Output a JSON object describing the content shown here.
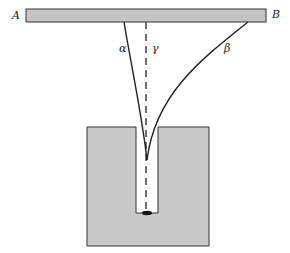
{
  "diagram": {
    "labels": {
      "end_left": "A",
      "end_right": "B",
      "path_alpha": "α",
      "path_beta": "β",
      "path_gamma": "γ"
    },
    "colors": {
      "bar_fill": "#c4c4c4",
      "block_fill": "#c8c8c8",
      "stroke": "#222222"
    }
  }
}
